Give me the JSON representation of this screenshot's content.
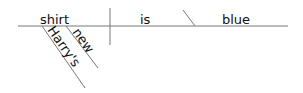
{
  "diagram": {
    "type": "sentence-diagram",
    "sentence": "Harry's new shirt is blue",
    "subject": "shirt",
    "verb": "is",
    "predicate_adjective": "blue",
    "modifiers": [
      {
        "word": "Harry's",
        "modifies": "shirt"
      },
      {
        "word": "new",
        "modifies": "shirt"
      }
    ],
    "colors": {
      "line": "#777777",
      "text": "#111111"
    }
  }
}
